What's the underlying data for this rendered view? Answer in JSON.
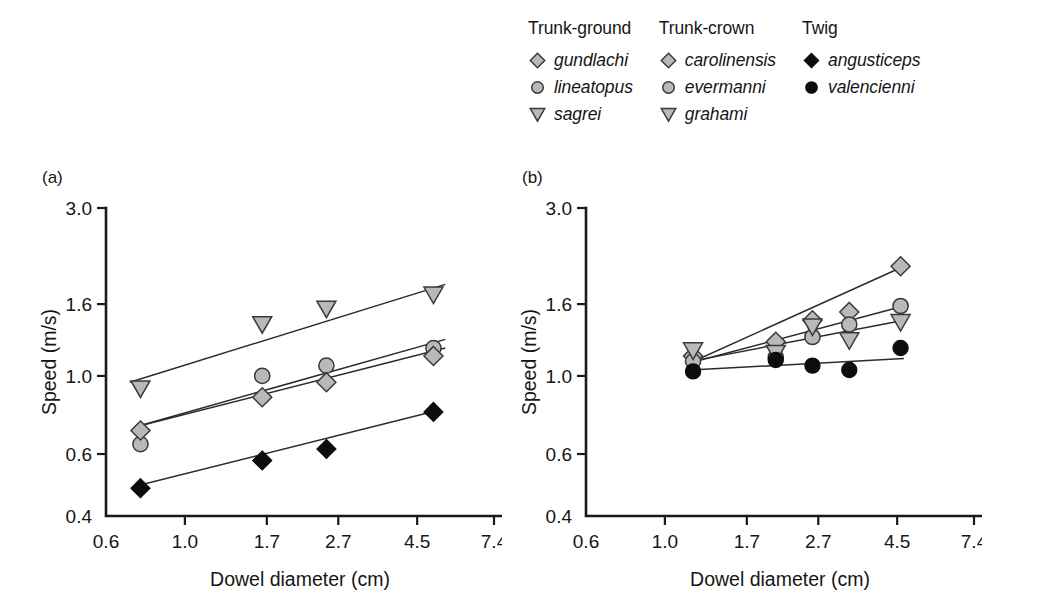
{
  "figure": {
    "panels": [
      {
        "id": "a",
        "tag": "(a)",
        "xlabel": "Dowel diameter (cm)",
        "ylabel": "Speed (m/s)"
      },
      {
        "id": "b",
        "tag": "(b)",
        "xlabel": "Dowel diameter (cm)",
        "ylabel": "Speed (m/s)"
      }
    ]
  },
  "legend": {
    "groups": [
      {
        "heading": "Trunk-ground",
        "entries": [
          {
            "label": "gundlachi",
            "marker": "diamond-open-icon",
            "symbol": "diamond",
            "fill": "open"
          },
          {
            "label": "lineatopus",
            "marker": "circle-open-icon",
            "symbol": "circle",
            "fill": "open"
          },
          {
            "label": "sagrei",
            "marker": "triangle-open-icon",
            "symbol": "triangle",
            "fill": "open"
          }
        ]
      },
      {
        "heading": "Trunk-crown",
        "entries": [
          {
            "label": "carolinensis",
            "marker": "diamond-open-icon",
            "symbol": "diamond",
            "fill": "open"
          },
          {
            "label": "evermanni",
            "marker": "circle-open-icon",
            "symbol": "circle",
            "fill": "open"
          },
          {
            "label": "grahami",
            "marker": "triangle-open-icon",
            "symbol": "triangle",
            "fill": "open"
          }
        ]
      },
      {
        "heading": "Twig",
        "entries": [
          {
            "label": "angusticeps",
            "marker": "diamond-filled-icon",
            "symbol": "diamond",
            "fill": "filled"
          },
          {
            "label": "valencienni",
            "marker": "circle-filled-icon",
            "symbol": "circle",
            "fill": "filled"
          }
        ]
      }
    ]
  },
  "colors": {
    "marker_open_fill": "#b9b9b9",
    "marker_open_stroke": "#3a3a3a",
    "marker_filled": "#0d0d0d",
    "axis": "#1a1a1a",
    "fit_line": "#2b2b2b",
    "background": "#ffffff"
  },
  "chart_data": [
    {
      "type": "scatter",
      "panel": "a",
      "title": "(a)",
      "xlabel": "Dowel diameter (cm)",
      "ylabel": "Speed (m/s)",
      "xscale": "log",
      "yscale": "log",
      "xlim": [
        0.6,
        7.4
      ],
      "ylim": [
        0.4,
        3.0
      ],
      "xticks": [
        0.6,
        1.0,
        1.7,
        2.7,
        4.5,
        7.4
      ],
      "xticklabels": [
        "0.6",
        "1.0",
        "1.7",
        "2.7",
        "4.5",
        "7.4"
      ],
      "yticks": [
        0.4,
        0.6,
        1.0,
        1.6,
        3.0
      ],
      "yticklabels": [
        "0.4",
        "0.6",
        "1.0",
        "1.6",
        "3.0"
      ],
      "grid": false,
      "legend_position": "above-figure",
      "series": [
        {
          "name": "sagrei",
          "group": "Trunk-ground",
          "symbol": "triangle",
          "fill": "open",
          "x": [
            0.75,
            1.65,
            2.5,
            5.0
          ],
          "y": [
            0.92,
            1.4,
            1.55,
            1.7
          ],
          "fit_line": {
            "x": [
              0.7,
              5.4
            ],
            "y": [
              0.96,
              1.82
            ]
          }
        },
        {
          "name": "lineatopus",
          "group": "Trunk-ground",
          "symbol": "circle",
          "fill": "open",
          "x": [
            0.75,
            1.65,
            2.5,
            5.0
          ],
          "y": [
            0.64,
            1.0,
            1.07,
            1.2
          ],
          "fit_line": {
            "x": [
              0.72,
              5.4
            ],
            "y": [
              0.715,
              1.27
            ]
          }
        },
        {
          "name": "gundlachi",
          "group": "Trunk-ground",
          "symbol": "diamond",
          "fill": "open",
          "x": [
            0.75,
            1.65,
            2.5,
            5.0
          ],
          "y": [
            0.7,
            0.87,
            0.96,
            1.14
          ],
          "fit_line": {
            "x": [
              0.72,
              5.4
            ],
            "y": [
              0.715,
              1.2
            ]
          }
        },
        {
          "name": "angusticeps",
          "group": "Twig",
          "symbol": "diamond",
          "fill": "filled",
          "x": [
            0.75,
            1.65,
            2.5,
            5.0
          ],
          "y": [
            0.48,
            0.575,
            0.62,
            0.79
          ],
          "fit_line": {
            "x": [
              0.72,
              5.2
            ],
            "y": [
              0.485,
              0.8
            ]
          }
        }
      ]
    },
    {
      "type": "scatter",
      "panel": "b",
      "title": "(b)",
      "xlabel": "Dowel diameter (cm)",
      "ylabel": "Speed (m/s)",
      "xscale": "log",
      "yscale": "log",
      "xlim": [
        0.6,
        7.4
      ],
      "ylim": [
        0.4,
        3.0
      ],
      "xticks": [
        0.6,
        1.0,
        1.7,
        2.7,
        4.5,
        7.4
      ],
      "xticklabels": [
        "0.6",
        "1.0",
        "1.7",
        "2.7",
        "4.5",
        "7.4"
      ],
      "yticks": [
        0.4,
        0.6,
        1.0,
        1.6,
        3.0
      ],
      "yticklabels": [
        "0.4",
        "0.6",
        "1.0",
        "1.6",
        "3.0"
      ],
      "grid": false,
      "legend_position": "above-figure",
      "series": [
        {
          "name": "carolinensis",
          "group": "Trunk-crown",
          "symbol": "diamond",
          "fill": "open",
          "x": [
            1.2,
            2.05,
            2.6,
            3.3,
            4.6
          ],
          "y": [
            1.14,
            1.25,
            1.44,
            1.52,
            2.05
          ],
          "fit_line": {
            "x": [
              1.18,
              4.7
            ],
            "y": [
              1.09,
              2.05
            ]
          }
        },
        {
          "name": "evermanni",
          "group": "Trunk-crown",
          "symbol": "circle",
          "fill": "open",
          "x": [
            1.2,
            2.05,
            2.6,
            3.3,
            4.6
          ],
          "y": [
            1.1,
            1.13,
            1.29,
            1.4,
            1.58
          ],
          "fit_line": {
            "x": [
              1.18,
              4.7
            ],
            "y": [
              1.09,
              1.58
            ]
          }
        },
        {
          "name": "grahami",
          "group": "Trunk-crown",
          "symbol": "triangle",
          "fill": "open",
          "x": [
            1.2,
            2.05,
            2.6,
            3.3,
            4.6
          ],
          "y": [
            1.18,
            1.16,
            1.38,
            1.26,
            1.42
          ],
          "fit_line": {
            "x": [
              1.18,
              4.7
            ],
            "y": [
              1.1,
              1.44
            ]
          }
        },
        {
          "name": "valencienni",
          "group": "Twig",
          "symbol": "circle",
          "fill": "filled",
          "x": [
            1.2,
            2.05,
            2.6,
            3.3,
            4.6
          ],
          "y": [
            1.03,
            1.11,
            1.07,
            1.04,
            1.2
          ],
          "fit_line": {
            "x": [
              1.18,
              4.7
            ],
            "y": [
              1.04,
              1.12
            ]
          }
        }
      ]
    }
  ]
}
